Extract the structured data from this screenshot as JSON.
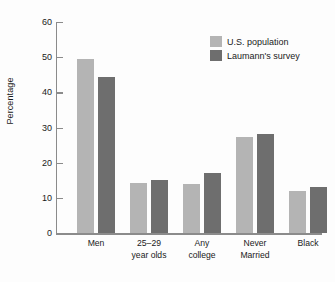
{
  "chart_data": {
    "type": "bar",
    "title": "",
    "xlabel": "",
    "ylabel": "Percentage",
    "ylim": [
      0,
      60
    ],
    "yticks": [
      0,
      10,
      20,
      30,
      40,
      50,
      60
    ],
    "ytick_labels": [
      "0",
      "10",
      "20",
      "30",
      "40",
      "50",
      "60"
    ],
    "grid": false,
    "legend_position": "top-right",
    "categories": [
      "Men",
      "25–29\nyear olds",
      "Any\ncollege",
      "Never\nMarried",
      "Black"
    ],
    "category_lines": [
      [
        "Men"
      ],
      [
        "25–29",
        "year olds"
      ],
      [
        "Any",
        "college"
      ],
      [
        "Never",
        "Married"
      ],
      [
        "Black"
      ]
    ],
    "series": [
      {
        "name": "U.S. population",
        "color": "#b4b4b4",
        "values": [
          49.5,
          14.3,
          14.0,
          27.2,
          12.0
        ]
      },
      {
        "name": "Laumann's survey",
        "color": "#6e6e6e",
        "values": [
          44.5,
          15.0,
          17.0,
          28.2,
          13.0
        ]
      }
    ]
  },
  "legend": {
    "entries": [
      {
        "label": "U.S. population",
        "color": "#b4b4b4"
      },
      {
        "label": "Laumann's survey",
        "color": "#6e6e6e"
      }
    ]
  },
  "axes": {
    "y_title": "Percentage"
  }
}
